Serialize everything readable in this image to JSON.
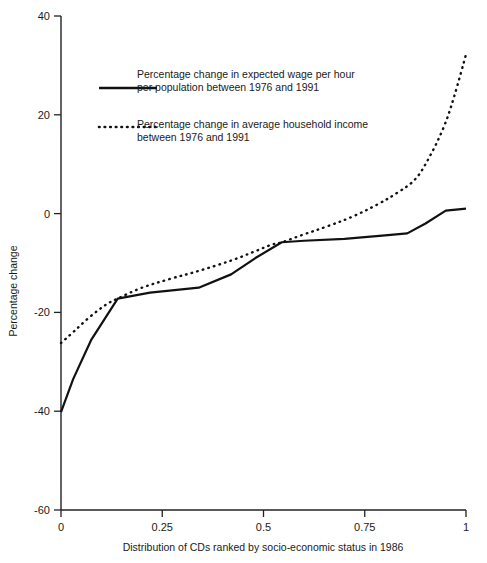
{
  "chart_data": {
    "type": "line",
    "title": "",
    "xlabel": "Distribution of CDs ranked by socio-economic status in 1986",
    "ylabel": "Percentage change",
    "xlim": [
      0,
      1
    ],
    "ylim": [
      -60,
      40
    ],
    "grid": false,
    "legend_position": "upper-left-inside",
    "xticks": [
      0,
      0.25,
      0.5,
      0.75,
      1
    ],
    "xtick_labels": [
      "0",
      "0.25",
      "0.5",
      "0.75",
      "1"
    ],
    "yticks": [
      40,
      20,
      0,
      -20,
      -40,
      -60
    ],
    "ytick_labels": [
      "40",
      "20",
      "0",
      "-20",
      "-40",
      "-60"
    ],
    "series": [
      {
        "name": "Percentage change in expected wage per hour per population between 1976 and 1991",
        "style": "solid",
        "color": "#111111",
        "x": [
          0.0,
          0.03,
          0.075,
          0.14,
          0.22,
          0.34,
          0.42,
          0.48,
          0.545,
          0.6,
          0.7,
          0.8,
          0.855,
          0.9,
          0.95,
          1.0
        ],
        "y": [
          -40.2,
          -33.5,
          -25.5,
          -17.2,
          -16.0,
          -15.0,
          -12.3,
          -9.0,
          -5.8,
          -5.5,
          -5.1,
          -4.4,
          -4.0,
          -2.0,
          0.6,
          1.0
        ]
      },
      {
        "name": "Percentage change in average household income between 1976 and 1991",
        "style": "dotted",
        "color": "#111111",
        "x": [
          0.0,
          0.03,
          0.07,
          0.11,
          0.14,
          0.2,
          0.27,
          0.34,
          0.42,
          0.48,
          0.52,
          0.545,
          0.6,
          0.66,
          0.72,
          0.78,
          0.83,
          0.875,
          0.91,
          0.945,
          0.97,
          1.0
        ],
        "y": [
          -26.2,
          -24.0,
          -21.0,
          -18.5,
          -17.2,
          -15.0,
          -13.2,
          -11.6,
          -9.5,
          -7.6,
          -6.3,
          -5.8,
          -4.2,
          -2.5,
          -0.6,
          1.8,
          4.2,
          7.0,
          11.5,
          17.5,
          23.5,
          32.2
        ]
      }
    ],
    "legend": [
      {
        "marker": "solid-line",
        "line1": "Percentage change in expected wage per hour",
        "line2": "per population between 1976 and 1991"
      },
      {
        "marker": "dotted-line",
        "line1": "Percentage change in average household income",
        "line2": "between 1976 and 1991"
      }
    ]
  },
  "geometry": {
    "plot_left": 61,
    "plot_right": 466,
    "y_top_value_px": 16,
    "y_bottom_value_px": 510
  }
}
